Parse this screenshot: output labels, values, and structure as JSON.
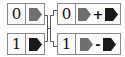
{
  "colors": {
    "gray_block": "#6f6f6f",
    "black_block": "#1a1a1a",
    "border": "#8a8a8a",
    "wire": "#555555"
  },
  "inputs": [
    {
      "index": "0",
      "block": "gray"
    },
    {
      "index": "1",
      "block": "black"
    }
  ],
  "outputs": [
    {
      "index": "0",
      "left_block": "gray",
      "operator": "+",
      "right_block": "black"
    },
    {
      "index": "1",
      "left_block": "gray",
      "operator": "-",
      "right_block": "black"
    }
  ]
}
